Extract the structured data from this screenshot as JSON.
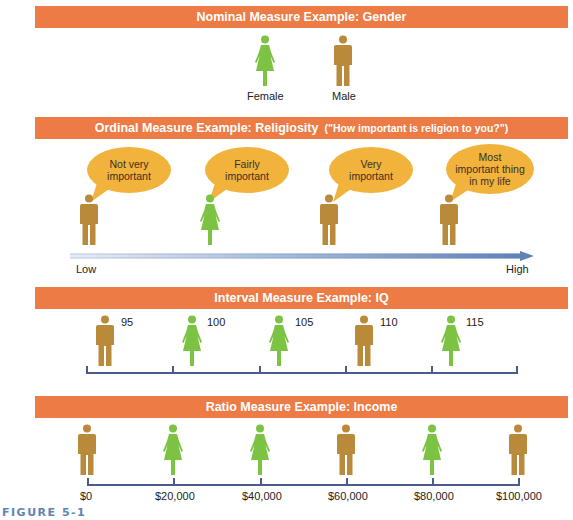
{
  "colors": {
    "banner": "#ec7b45",
    "female": "#7cc243",
    "male": "#b88a3a",
    "bubble": "#f2b33d",
    "axis": "#4a5a8a",
    "arrow_start": "#e6ecf5",
    "arrow_end": "#5f82b8",
    "caption": "#5d84b4"
  },
  "nominal": {
    "title": "Nominal Measure Example:  Gender",
    "figures": [
      {
        "gender": "female",
        "label": "Female"
      },
      {
        "gender": "male",
        "label": "Male"
      }
    ]
  },
  "ordinal": {
    "title": "Ordinal Measure Example:  Religiosity",
    "subtitle": "(\"How important is religion to you?\")",
    "items": [
      {
        "gender": "male",
        "bubble": [
          "Not very",
          "important"
        ]
      },
      {
        "gender": "female",
        "bubble": [
          "Fairly",
          "important"
        ]
      },
      {
        "gender": "male",
        "bubble": [
          "Very",
          "important"
        ]
      },
      {
        "gender": "male",
        "bubble": [
          "Most",
          "important thing",
          "in my life"
        ]
      }
    ],
    "low_label": "Low",
    "high_label": "High"
  },
  "interval": {
    "title": "Interval Measure Example:  IQ",
    "items": [
      {
        "gender": "male",
        "value": "95"
      },
      {
        "gender": "female",
        "value": "100"
      },
      {
        "gender": "female",
        "value": "105"
      },
      {
        "gender": "male",
        "value": "110"
      },
      {
        "gender": "female",
        "value": "115"
      }
    ]
  },
  "ratio": {
    "title": "Ratio Measure Example:  Income",
    "items": [
      {
        "gender": "male",
        "value": "$0"
      },
      {
        "gender": "female",
        "value": "$20,000"
      },
      {
        "gender": "female",
        "value": "$40,000"
      },
      {
        "gender": "male",
        "value": "$60,000"
      },
      {
        "gender": "female",
        "value": "$80,000"
      },
      {
        "gender": "male",
        "value": "$100,000"
      }
    ]
  },
  "caption": "FIGURE 5-1"
}
